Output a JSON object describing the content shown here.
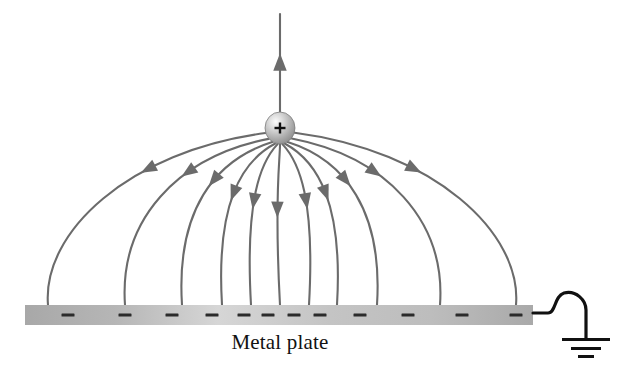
{
  "figure": {
    "kind": "physics-diagram",
    "title_visible": false,
    "background_color": "#ffffff",
    "line_color": "#6b6b6b",
    "ink_color": "#111111",
    "plate_label": "Metal plate",
    "charge_symbol": "+"
  },
  "charge": {
    "name": "positive-point-charge",
    "symbol": "+",
    "cx": 280,
    "cy": 128,
    "rx": 15,
    "ry": 16,
    "fill_light": "#f2f2f2",
    "fill_mid": "#b9b9b9",
    "fill_dark": "#8e8e8e",
    "edge": "#7c7c7c"
  },
  "plate": {
    "name": "metal-plate",
    "x": 25,
    "y": 305,
    "width": 508,
    "height": 20,
    "fill_left": "#a8a8a8",
    "fill_mid": "#d2d2d2",
    "fill_right": "#aeaeae",
    "minus_color": "#2b2b2b",
    "minus_count": 12,
    "minus_x": [
      68,
      125,
      172,
      212,
      244,
      268,
      294,
      320,
      360,
      408,
      462,
      516
    ],
    "minus_y": 315,
    "minus_width": 13,
    "minus_height": 3
  },
  "ground": {
    "name": "ground-symbol",
    "wire_start_x": 533,
    "wire_start_y": 313,
    "stem_x": 580,
    "bars": [
      {
        "half_width": 24,
        "y": 338,
        "thickness": 3
      },
      {
        "half_width": 15,
        "y": 347,
        "thickness": 3
      },
      {
        "half_width": 8,
        "y": 355,
        "thickness": 3
      }
    ],
    "color": "#111111"
  },
  "field_lines": {
    "count_to_plate": 11,
    "count_upward": 1,
    "upward": {
      "name": "field-line-up",
      "x": 280,
      "top_y": 14,
      "bottom_y": 112,
      "arrow_y": 62,
      "direction": "up"
    },
    "lines": [
      {
        "id": "L1",
        "side": "left",
        "end_x": 48,
        "arrow_t": 0.33
      },
      {
        "id": "L2",
        "side": "left",
        "end_x": 125,
        "arrow_t": 0.34
      },
      {
        "id": "L3",
        "side": "left",
        "end_x": 182,
        "arrow_t": 0.4
      },
      {
        "id": "L4",
        "side": "left",
        "end_x": 222,
        "arrow_t": 0.5
      },
      {
        "id": "L5",
        "side": "left",
        "end_x": 251,
        "arrow_t": 0.56
      },
      {
        "id": "C0",
        "side": "center",
        "end_x": 280,
        "arrow_t": 0.62
      },
      {
        "id": "R5",
        "side": "right",
        "end_x": 309,
        "arrow_t": 0.56
      },
      {
        "id": "R4",
        "side": "right",
        "end_x": 337,
        "arrow_t": 0.5
      },
      {
        "id": "R3",
        "side": "right",
        "end_x": 377,
        "arrow_t": 0.4
      },
      {
        "id": "R2",
        "side": "right",
        "end_x": 440,
        "arrow_t": 0.34
      },
      {
        "id": "R1",
        "side": "right",
        "end_x": 516,
        "arrow_t": 0.33
      }
    ]
  }
}
